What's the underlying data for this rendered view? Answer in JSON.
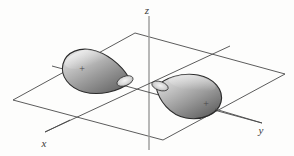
{
  "figure": {
    "background_color": "#fdfdfc",
    "axes": {
      "x": {
        "label": "x",
        "color": "#4a4a4a"
      },
      "y": {
        "label": "y",
        "color": "#4a4a4a"
      },
      "z": {
        "label": "z",
        "color": "#8a8a8a"
      }
    },
    "plane": {
      "name": "xy-plane",
      "stroke_color": "#4a4a4a"
    },
    "lobes": [
      {
        "id": "upper-left-lobe",
        "sign": "+",
        "fill_light": "#cfcfcf",
        "fill_dark": "#6e6e6e",
        "outline": "#2b2b2b",
        "direction": "negative-x"
      },
      {
        "id": "lower-right-lobe",
        "sign": "+",
        "fill_light": "#cfcfcf",
        "fill_dark": "#6e6e6e",
        "outline": "#2b2b2b",
        "direction": "positive-y"
      }
    ]
  }
}
